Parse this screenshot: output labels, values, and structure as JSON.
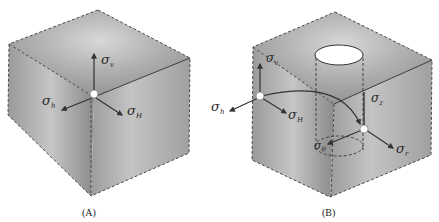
{
  "figure": {
    "panels": [
      {
        "id": "A",
        "caption": "(A)",
        "description": "Intact rock cube under far-field in-situ stresses",
        "labels": {
          "sigma_v": {
            "base": "σ",
            "sub": "v"
          },
          "sigma_h": {
            "base": "σ",
            "sub": "h"
          },
          "sigma_H": {
            "base": "σ",
            "sub": "H"
          }
        }
      },
      {
        "id": "B",
        "caption": "(B)",
        "description": "Rock cube with vertical wellbore; far-field stresses transformed to borehole-wall stresses",
        "labels": {
          "sigma_v": {
            "base": "σ",
            "sub": "v"
          },
          "sigma_h": {
            "base": "σ",
            "sub": "h"
          },
          "sigma_H": {
            "base": "σ",
            "sub": "H"
          },
          "sigma_z": {
            "base": "σ",
            "sub": "z"
          },
          "sigma_theta": {
            "base": "σ",
            "sub": "θ"
          },
          "sigma_r": {
            "base": "σ",
            "sub": "r"
          }
        }
      }
    ],
    "colors": {
      "cube_light": "#d6d6d6",
      "cube_mid": "#a8a8a8",
      "cube_dark": "#8c8c8c",
      "edge": "#3a3a3a",
      "arrow": "#333333",
      "marker": "#ffffff"
    }
  }
}
